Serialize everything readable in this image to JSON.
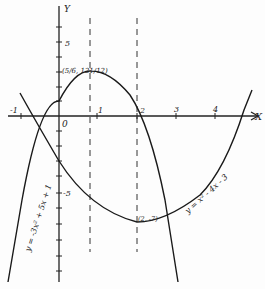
{
  "axes": {
    "x_label": "X",
    "y_label": "Y",
    "origin_label": "0",
    "x_ticks": [
      {
        "value": -1,
        "label": "-1"
      },
      {
        "value": 1,
        "label": "1"
      },
      {
        "value": 2,
        "label": "2"
      },
      {
        "value": 3,
        "label": "3"
      },
      {
        "value": 4,
        "label": "4"
      }
    ],
    "y_ticks": [
      {
        "value": 5,
        "label": "5"
      },
      {
        "value": -5,
        "label": "-5"
      }
    ]
  },
  "curves": [
    {
      "name": "parabola-down",
      "equation_label": "y = -3x² + 5x + 1",
      "vertex_label": "(5/6, 121/12)"
    },
    {
      "name": "parabola-up",
      "equation_label": "y = x² - 4x - 3",
      "vertex_label": "(2, -7)"
    }
  ],
  "dashed_lines": [
    {
      "x": 0.8333
    },
    {
      "x": 2
    }
  ]
}
